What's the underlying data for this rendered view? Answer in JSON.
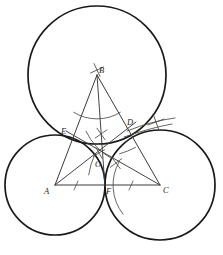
{
  "figure": {
    "background_color": "#ffffff",
    "ink_color": "#1a1a1a",
    "construction_color": "#4a4a46",
    "width": 223,
    "height": 255
  },
  "labels": {
    "A": "A",
    "B": "B",
    "C": "C",
    "D": "D",
    "E": "E",
    "F": "F",
    "O": "O"
  },
  "points": {
    "A": {
      "name": "A",
      "x": 55,
      "y": 185,
      "role": "triangle-vertex"
    },
    "B": {
      "name": "B",
      "x": 97,
      "y": 75,
      "role": "triangle-vertex"
    },
    "C": {
      "name": "C",
      "x": 160,
      "y": 185,
      "role": "triangle-vertex"
    },
    "D": {
      "name": "D",
      "x": 130,
      "y": 128,
      "role": "tangent-point-BC"
    },
    "E": {
      "name": "E",
      "x": 70,
      "y": 137,
      "role": "tangent-point-AB"
    },
    "F": {
      "name": "F",
      "x": 105,
      "y": 185,
      "role": "tangent-point-AC"
    },
    "O": {
      "name": "O",
      "x": 100,
      "y": 160,
      "role": "incenter"
    }
  },
  "label_positions": {
    "A": {
      "x": 44,
      "y": 187
    },
    "B": {
      "x": 99,
      "y": 66
    },
    "C": {
      "x": 163,
      "y": 186
    },
    "D": {
      "x": 127,
      "y": 118
    },
    "E": {
      "x": 61,
      "y": 127
    },
    "F": {
      "x": 106,
      "y": 187
    },
    "O": {
      "x": 95,
      "y": 160
    }
  },
  "circles": [
    {
      "name": "circle-at-B",
      "center": "B",
      "cx": 97,
      "cy": 75,
      "r": 69
    },
    {
      "name": "circle-at-A",
      "center": "A",
      "cx": 55,
      "cy": 185,
      "r": 50
    },
    {
      "name": "circle-at-C",
      "center": "C",
      "cx": 160,
      "cy": 185,
      "r": 55
    }
  ],
  "triangle": {
    "name": "triangle-ABC",
    "vertices": [
      "A",
      "B",
      "C"
    ],
    "sides": [
      {
        "name": "side-AB",
        "from": "A",
        "to": "B"
      },
      {
        "name": "side-BC",
        "from": "B",
        "to": "C"
      },
      {
        "name": "side-AC",
        "from": "A",
        "to": "C"
      }
    ]
  },
  "bisectors": [
    {
      "name": "bisector-from-B",
      "from": "B",
      "to": "F"
    },
    {
      "name": "bisector-from-A",
      "from": "A",
      "to": "D"
    },
    {
      "name": "bisector-from-C",
      "from": "C",
      "to": "E"
    }
  ],
  "construction_arcs": [
    {
      "name": "arc-at-B",
      "cx": 97,
      "cy": 75,
      "r": 44,
      "start_deg": 58,
      "end_deg": 122
    },
    {
      "name": "arc-at-C",
      "cx": 160,
      "cy": 185,
      "r": 47,
      "start_deg": 150,
      "end_deg": 218
    },
    {
      "name": "arc-at-A-small",
      "cx": 55,
      "cy": 185,
      "r": 62,
      "start_deg": 300,
      "end_deg": 335
    },
    {
      "name": "arc-cross-upper",
      "cx": 97,
      "cy": 75,
      "r": 82,
      "start_deg": 62,
      "end_deg": 74
    },
    {
      "name": "arc-cross-right",
      "cx": 160,
      "cy": 185,
      "r": 72,
      "start_deg": 188,
      "end_deg": 206
    }
  ],
  "cross_marks": [
    {
      "name": "cross-mark-above-B",
      "x": 97,
      "y": 70,
      "size": 5,
      "rot": 20
    },
    {
      "name": "cross-mark-mid",
      "x": 101,
      "y": 134,
      "size": 5,
      "rot": 10
    },
    {
      "name": "cross-mark-near-O",
      "x": 99,
      "y": 153,
      "size": 4.5,
      "rot": 15
    },
    {
      "name": "cross-mark-right-of-O",
      "x": 116,
      "y": 163,
      "size": 5,
      "rot": 8
    },
    {
      "name": "cross-mark-far-right",
      "x": 156,
      "y": 122,
      "size": 6,
      "rot": 25
    }
  ]
}
